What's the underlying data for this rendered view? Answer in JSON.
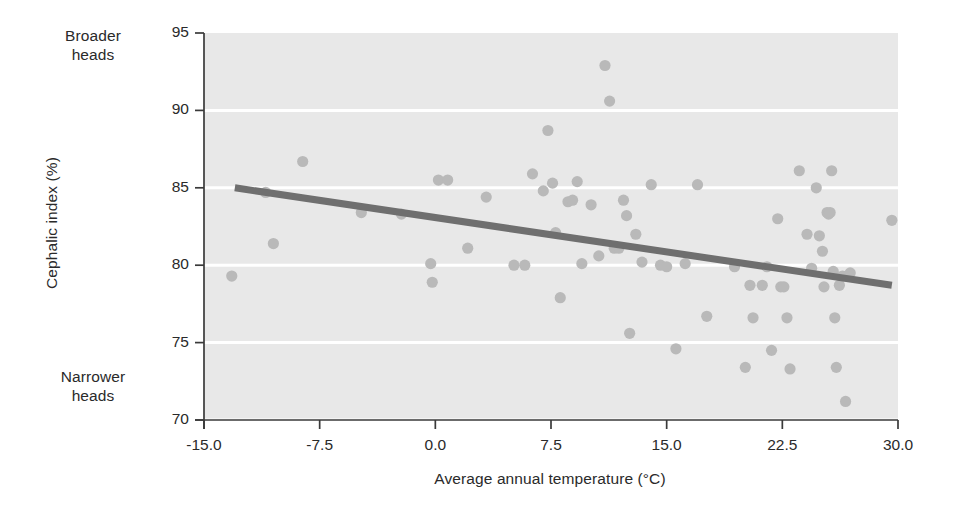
{
  "figure": {
    "annotations": {
      "top_left": "Broader\nheads",
      "top_left_line1": "Broader",
      "top_left_line2": "heads",
      "bottom_left_line1": "Narrower",
      "bottom_left_line2": "heads"
    },
    "colors": {
      "plot_background": "#e8e8e8",
      "gridline": "#ffffff",
      "point_fill": "#b9b9b9",
      "trend_line": "#6f6f6f",
      "axis": "#3a3a3a",
      "text": "#2a2a2a",
      "page_background": "#ffffff"
    }
  },
  "chart_data": {
    "type": "scatter",
    "title": "",
    "xlabel": "Average annual temperature (°C)",
    "ylabel": "Cephalic index (%)",
    "xlim": [
      -15.0,
      30.0
    ],
    "ylim": [
      70,
      95
    ],
    "xticks": [
      "-15.0",
      "-7.5",
      "0.0",
      "7.5",
      "15.0",
      "22.5",
      "30.0"
    ],
    "xtick_values": [
      -15.0,
      -7.5,
      0.0,
      7.5,
      15.0,
      22.5,
      30.0
    ],
    "yticks": [
      "70",
      "75",
      "80",
      "85",
      "90",
      "95"
    ],
    "ytick_values": [
      70,
      75,
      80,
      85,
      90,
      95
    ],
    "grid": "horizontal white gridlines at each y tick",
    "legend": "none",
    "series": [
      {
        "name": "Populations",
        "marker": "filled circle",
        "points": [
          [
            -13.2,
            79.3
          ],
          [
            -11.0,
            84.7
          ],
          [
            -10.5,
            81.4
          ],
          [
            -8.6,
            86.7
          ],
          [
            -4.8,
            83.4
          ],
          [
            -2.2,
            83.3
          ],
          [
            -0.3,
            80.1
          ],
          [
            -0.2,
            78.9
          ],
          [
            0.2,
            85.5
          ],
          [
            0.8,
            85.5
          ],
          [
            2.1,
            81.1
          ],
          [
            3.3,
            84.4
          ],
          [
            5.1,
            80.0
          ],
          [
            5.8,
            80.0
          ],
          [
            6.3,
            85.9
          ],
          [
            7.0,
            84.8
          ],
          [
            7.3,
            88.7
          ],
          [
            7.6,
            85.3
          ],
          [
            7.8,
            82.1
          ],
          [
            8.1,
            77.9
          ],
          [
            8.6,
            84.1
          ],
          [
            8.9,
            84.2
          ],
          [
            9.2,
            85.4
          ],
          [
            9.5,
            80.1
          ],
          [
            10.1,
            83.9
          ],
          [
            10.6,
            80.6
          ],
          [
            11.0,
            92.9
          ],
          [
            11.3,
            90.6
          ],
          [
            11.6,
            81.1
          ],
          [
            11.9,
            81.1
          ],
          [
            12.2,
            84.2
          ],
          [
            12.4,
            83.2
          ],
          [
            12.6,
            75.6
          ],
          [
            13.0,
            82.0
          ],
          [
            13.4,
            80.2
          ],
          [
            14.0,
            85.2
          ],
          [
            14.6,
            80.0
          ],
          [
            15.0,
            79.9
          ],
          [
            15.6,
            74.6
          ],
          [
            16.2,
            80.1
          ],
          [
            17.0,
            85.2
          ],
          [
            17.6,
            76.7
          ],
          [
            19.4,
            79.9
          ],
          [
            20.1,
            73.4
          ],
          [
            20.4,
            78.7
          ],
          [
            20.6,
            76.6
          ],
          [
            21.2,
            78.7
          ],
          [
            21.5,
            79.9
          ],
          [
            21.8,
            74.5
          ],
          [
            22.2,
            83.0
          ],
          [
            22.4,
            78.6
          ],
          [
            22.6,
            78.6
          ],
          [
            22.8,
            76.6
          ],
          [
            23.0,
            73.3
          ],
          [
            23.6,
            86.1
          ],
          [
            24.1,
            82.0
          ],
          [
            24.4,
            79.8
          ],
          [
            24.7,
            85.0
          ],
          [
            24.9,
            81.9
          ],
          [
            25.1,
            80.9
          ],
          [
            25.2,
            78.6
          ],
          [
            25.4,
            83.4
          ],
          [
            25.5,
            83.3
          ],
          [
            25.6,
            83.4
          ],
          [
            25.7,
            86.1
          ],
          [
            25.8,
            79.6
          ],
          [
            25.9,
            76.6
          ],
          [
            26.0,
            73.4
          ],
          [
            26.2,
            78.7
          ],
          [
            26.4,
            79.3
          ],
          [
            26.6,
            71.2
          ],
          [
            26.9,
            79.5
          ],
          [
            29.6,
            82.9
          ]
        ]
      }
    ],
    "trend_line": {
      "name": "regression line",
      "x_start": -13.0,
      "y_start": 85.0,
      "x_end": 29.6,
      "y_end": 78.7
    }
  }
}
